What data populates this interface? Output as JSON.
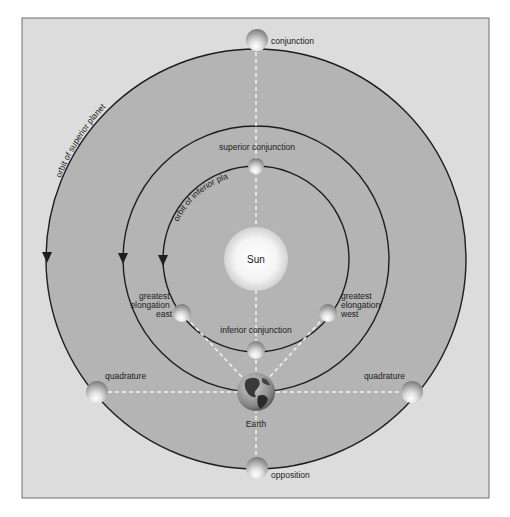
{
  "diagram": {
    "center": {
      "x": 256,
      "y": 259
    },
    "colors": {
      "page_background": "#ffffff",
      "frame_fill": "#dcdcdc",
      "frame_border": "#6e6e6e",
      "orbit_region_fill": "#b4b4b4",
      "orbit_line": "#1e1e1e",
      "dashed_line": "#f4f4f4",
      "label_text": "#1a1a1a"
    },
    "orbits": [
      {
        "id": "superior",
        "label": "orbit of superior planet",
        "radius": 210
      },
      {
        "id": "earth",
        "label": "",
        "radius": 133
      },
      {
        "id": "inferior",
        "label": "orbit of inferior planet",
        "radius": 93
      }
    ],
    "sun": {
      "label": "Sun",
      "radius": 32
    },
    "earth": {
      "label": "Earth",
      "x": 256,
      "y": 392,
      "radius": 19
    },
    "positions": [
      {
        "id": "conjunction",
        "label": "conjunction",
        "x": 257,
        "y": 40,
        "r": 11
      },
      {
        "id": "superior-conjunction",
        "label": "superior conjunction",
        "x": 256,
        "y": 166,
        "r": 8
      },
      {
        "id": "greatest-elongation-east",
        "label_lines": [
          "greatest",
          "elongation",
          "east"
        ],
        "x": 182,
        "y": 313,
        "r": 9
      },
      {
        "id": "greatest-elongation-west",
        "label_lines": [
          "greatest",
          "elongation",
          "west"
        ],
        "x": 328,
        "y": 313,
        "r": 9
      },
      {
        "id": "inferior-conjunction",
        "label": "inferior conjunction",
        "x": 256,
        "y": 350,
        "r": 9
      },
      {
        "id": "quadrature-left",
        "label": "quadrature",
        "x": 97,
        "y": 392,
        "r": 11
      },
      {
        "id": "quadrature-right",
        "label": "quadrature",
        "x": 412,
        "y": 392,
        "r": 11
      },
      {
        "id": "opposition",
        "label": "opposition",
        "x": 257,
        "y": 468,
        "r": 11
      }
    ],
    "motion_direction": "counterclockwise"
  }
}
